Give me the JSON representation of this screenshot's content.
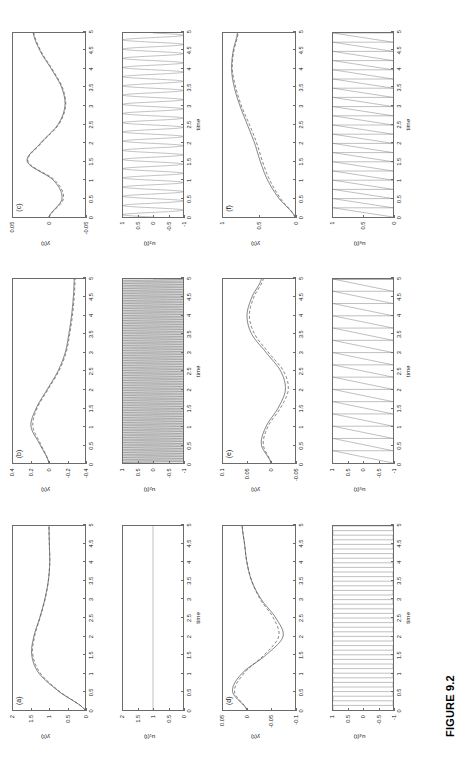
{
  "figure": {
    "caption": "FIGURE 9.2",
    "xlabel": "time",
    "y_axis_label": "y(t)"
  },
  "panels": [
    {
      "tag": "(a)",
      "u_label": "u₁(t)",
      "y_ticks": [
        "0",
        "0.5",
        "1",
        "1.5",
        "2"
      ],
      "y_ticklabels_top_to_bottom": [
        "2",
        "1.5",
        "1",
        "0.5",
        "0"
      ],
      "y_ylim": [
        0,
        2
      ],
      "u_ticks": [
        "-1",
        "-0.5",
        "0",
        "0.5",
        "1"
      ],
      "u_ticklabels_top_to_bottom": [
        "2",
        "1.5",
        "1",
        "0.5",
        "0"
      ],
      "u_ylim": [
        0,
        2
      ],
      "x_ticks": [
        "0",
        "0.5",
        "1",
        "1.5",
        "2",
        "2.5",
        "3",
        "3.5",
        "4",
        "4.5",
        "5"
      ]
    },
    {
      "tag": "(b)",
      "u_label": "u₂(t)",
      "y_ticklabels_top_to_bottom": [
        "0.4",
        "0.2",
        "0",
        "-0.2",
        "-0.4"
      ],
      "y_ylim": [
        -0.4,
        0.4
      ],
      "u_ticklabels_top_to_bottom": [
        "1",
        "0.5",
        "0",
        "-0.5",
        "-1"
      ],
      "u_ylim": [
        -1,
        1
      ],
      "x_ticks": [
        "0",
        "0.5",
        "1",
        "1.5",
        "2",
        "2.5",
        "3",
        "3.5",
        "4",
        "4.5",
        "5"
      ]
    },
    {
      "tag": "(c)",
      "u_label": "u₃(t)",
      "y_ticklabels_top_to_bottom": [
        "0.05",
        "0",
        "-0.05"
      ],
      "y_ylim": [
        -0.05,
        0.05
      ],
      "u_ticklabels_top_to_bottom": [
        "1",
        "0.5",
        "0",
        "-0.5",
        "-1"
      ],
      "u_ylim": [
        -1,
        1
      ],
      "x_ticks": [
        "0",
        "0.5",
        "1",
        "1.5",
        "2",
        "2.5",
        "3",
        "3.5",
        "4",
        "4.5",
        "5"
      ]
    },
    {
      "tag": "(d)",
      "u_label": "u₄(t)",
      "y_ticklabels_top_to_bottom": [
        "0.05",
        "0",
        "-0.05",
        "-0.1"
      ],
      "y_ylim": [
        -0.1,
        0.05
      ],
      "u_ticklabels_top_to_bottom": [
        "1",
        "0.5",
        "0",
        "-0.5",
        "-1"
      ],
      "u_ylim": [
        -1,
        1
      ],
      "x_ticks": [
        "0",
        "0.5",
        "1",
        "1.5",
        "2",
        "2.5",
        "3",
        "3.5",
        "4",
        "4.5",
        "5"
      ]
    },
    {
      "tag": "(e)",
      "u_label": "u₅(t)",
      "y_ticklabels_top_to_bottom": [
        "0.1",
        "0.05",
        "0",
        "-0.05"
      ],
      "y_ylim": [
        -0.05,
        0.1
      ],
      "u_ticklabels_top_to_bottom": [
        "1",
        "0.5",
        "0",
        "-0.5",
        "-1"
      ],
      "u_ylim": [
        -1,
        1
      ],
      "x_ticks": [
        "0",
        "0.5",
        "1",
        "1.5",
        "2",
        "2.5",
        "3",
        "3.5",
        "4",
        "4.5",
        "5"
      ]
    },
    {
      "tag": "(f)",
      "u_label": "u₆(t)",
      "y_ticklabels_top_to_bottom": [
        "1",
        "0.5",
        "0"
      ],
      "y_ylim": [
        0,
        1
      ],
      "u_ticklabels_top_to_bottom": [
        "1",
        "0.5",
        "0"
      ],
      "u_ylim": [
        0,
        1
      ],
      "x_ticks": [
        "0",
        "0.5",
        "1",
        "1.5",
        "2",
        "2.5",
        "3",
        "3.5",
        "4",
        "4.5",
        "5"
      ]
    }
  ],
  "chart_data": {
    "type": "line",
    "title": "FIGURE 9.2",
    "xlabel": "time",
    "ylabel": "y(t)",
    "x": [
      0,
      0.5,
      1,
      1.5,
      2,
      2.5,
      3,
      3.5,
      4,
      4.5,
      5
    ],
    "xlim": [
      0,
      5
    ],
    "grid": false,
    "legend": "none",
    "panels": [
      {
        "tag": "(a)",
        "input_name": "u₁(t)",
        "input_type": "constant",
        "input_value": 1,
        "input_ylim": [
          0,
          2
        ],
        "input_yticks": [
          0,
          0.5,
          1,
          1.5,
          2
        ],
        "output_ylim": [
          0,
          2
        ],
        "output_yticks": [
          0,
          0.5,
          1,
          1.5,
          2
        ],
        "series": [
          {
            "name": "y solid",
            "values": [
              0,
              0.72,
              1.28,
              1.48,
              1.42,
              1.26,
              1.12,
              1.02,
              0.98,
              0.99,
              1.0
            ]
          },
          {
            "name": "y dashed",
            "values": [
              0,
              0.7,
              1.24,
              1.45,
              1.4,
              1.25,
              1.11,
              1.02,
              0.98,
              0.99,
              1.0
            ]
          }
        ]
      },
      {
        "tag": "(b)",
        "input_name": "u₂(t)",
        "input_type": "high-frequency square/oscillation",
        "input_ylim": [
          -1,
          1
        ],
        "input_yticks": [
          -1,
          -0.5,
          0,
          0.5,
          1
        ],
        "output_ylim": [
          -0.4,
          0.4
        ],
        "output_yticks": [
          -0.4,
          -0.2,
          0,
          0.2,
          0.4
        ],
        "series": [
          {
            "name": "y solid",
            "values": [
              0,
              0.1,
              0.2,
              0.14,
              0.02,
              -0.1,
              -0.18,
              -0.22,
              -0.25,
              -0.27,
              -0.28
            ]
          },
          {
            "name": "y dashed",
            "values": [
              0,
              0.09,
              0.18,
              0.13,
              0.01,
              -0.11,
              -0.19,
              -0.23,
              -0.26,
              -0.28,
              -0.29
            ]
          }
        ]
      },
      {
        "tag": "(c)",
        "input_name": "u₃(t)",
        "input_type": "sinusoid",
        "input_ylim": [
          -1,
          1
        ],
        "input_yticks": [
          -1,
          -0.5,
          0,
          0.5,
          1
        ],
        "output_ylim": [
          -0.05,
          0.05
        ],
        "output_yticks": [
          -0.05,
          0,
          0.05
        ],
        "series": [
          {
            "name": "y solid",
            "values": [
              0,
              -0.018,
              -0.006,
              0.03,
              0.012,
              -0.012,
              -0.022,
              -0.018,
              -0.004,
              0.012,
              0.022
            ]
          },
          {
            "name": "y dashed",
            "values": [
              0,
              -0.02,
              -0.008,
              0.029,
              0.011,
              -0.013,
              -0.023,
              -0.019,
              -0.005,
              0.011,
              0.021
            ]
          }
        ]
      },
      {
        "tag": "(d)",
        "input_name": "u₄(t)",
        "input_type": "square wave",
        "input_ylim": [
          -1,
          1
        ],
        "input_yticks": [
          -1,
          -0.5,
          0,
          0.5,
          1
        ],
        "output_ylim": [
          -0.1,
          0.05
        ],
        "output_yticks": [
          -0.1,
          -0.05,
          0,
          0.05
        ],
        "series": [
          {
            "name": "y solid",
            "values": [
              0,
              0.03,
              0.01,
              -0.04,
              -0.075,
              -0.06,
              -0.03,
              -0.01,
              0.0,
              0.005,
              0.01
            ]
          },
          {
            "name": "y dashed",
            "values": [
              0,
              0.026,
              0.006,
              -0.036,
              -0.066,
              -0.055,
              -0.028,
              -0.01,
              0.0,
              0.005,
              0.01
            ]
          }
        ]
      },
      {
        "tag": "(e)",
        "input_name": "u₅(t)",
        "input_type": "sawtooth",
        "input_ylim": [
          -1,
          1
        ],
        "input_yticks": [
          -1,
          -0.5,
          0,
          0.5,
          1
        ],
        "output_ylim": [
          -0.05,
          0.1
        ],
        "output_yticks": [
          -0.05,
          0,
          0.05,
          0.1
        ],
        "series": [
          {
            "name": "y solid",
            "values": [
              0,
              0.02,
              0.01,
              -0.015,
              -0.03,
              -0.02,
              0.01,
              0.04,
              0.05,
              0.04,
              0.02
            ]
          },
          {
            "name": "y dashed",
            "values": [
              0,
              0.016,
              0.006,
              -0.02,
              -0.036,
              -0.026,
              0.005,
              0.034,
              0.045,
              0.036,
              0.016
            ]
          }
        ]
      },
      {
        "tag": "(f)",
        "input_name": "u₆(t)",
        "input_type": "sawtooth positive",
        "input_ylim": [
          0,
          1
        ],
        "input_yticks": [
          0,
          0.5,
          1
        ],
        "output_ylim": [
          0,
          1
        ],
        "output_yticks": [
          0,
          0.5,
          1
        ],
        "series": [
          {
            "name": "y solid",
            "values": [
              0,
              0.22,
              0.38,
              0.48,
              0.56,
              0.66,
              0.76,
              0.84,
              0.88,
              0.86,
              0.8
            ]
          },
          {
            "name": "y dashed",
            "values": [
              0,
              0.2,
              0.35,
              0.45,
              0.53,
              0.63,
              0.74,
              0.82,
              0.87,
              0.85,
              0.79
            ]
          }
        ]
      }
    ]
  }
}
